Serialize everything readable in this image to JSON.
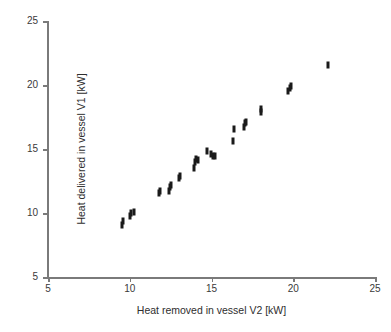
{
  "chart_data": {
    "type": "scatter",
    "title": "",
    "xlabel": "Heat removed in vessel V2 [kW]",
    "ylabel": "Heat delivered in vessel V1 [kW]",
    "xlim": [
      5,
      25
    ],
    "ylim": [
      5,
      25
    ],
    "xticks": [
      5,
      10,
      15,
      20,
      25
    ],
    "yticks": [
      5,
      10,
      15,
      20,
      25
    ],
    "xtick_labels": [
      "5",
      "10",
      "15",
      "20",
      "25"
    ],
    "ytick_labels": [
      "5",
      "10",
      "15",
      "20",
      "25"
    ],
    "grid": false,
    "legend": null,
    "marker": {
      "shape": "vertical-bar",
      "color": "#1a1a1a",
      "width_px": 3,
      "height_px": 7
    },
    "axis_color": "#7a7a7a",
    "background_color": "#ffffff",
    "series": [
      {
        "name": "Heat balance measurements",
        "points": [
          {
            "x": 9.5,
            "y": 9.1
          },
          {
            "x": 9.6,
            "y": 9.4
          },
          {
            "x": 10.0,
            "y": 9.8
          },
          {
            "x": 10.1,
            "y": 10.0
          },
          {
            "x": 10.25,
            "y": 10.1
          },
          {
            "x": 11.8,
            "y": 11.6
          },
          {
            "x": 11.85,
            "y": 11.75
          },
          {
            "x": 12.4,
            "y": 11.7
          },
          {
            "x": 12.45,
            "y": 12.0
          },
          {
            "x": 12.5,
            "y": 12.2
          },
          {
            "x": 13.0,
            "y": 12.7
          },
          {
            "x": 13.05,
            "y": 12.9
          },
          {
            "x": 13.95,
            "y": 13.55
          },
          {
            "x": 14.0,
            "y": 14.0
          },
          {
            "x": 14.05,
            "y": 14.2
          },
          {
            "x": 14.2,
            "y": 14.15
          },
          {
            "x": 14.75,
            "y": 14.85
          },
          {
            "x": 14.95,
            "y": 14.6
          },
          {
            "x": 15.1,
            "y": 14.45
          },
          {
            "x": 15.2,
            "y": 14.45
          },
          {
            "x": 16.3,
            "y": 15.6
          },
          {
            "x": 16.35,
            "y": 16.6
          },
          {
            "x": 17.0,
            "y": 16.7
          },
          {
            "x": 17.05,
            "y": 17.0
          },
          {
            "x": 17.1,
            "y": 17.1
          },
          {
            "x": 18.0,
            "y": 17.9
          },
          {
            "x": 18.05,
            "y": 18.1
          },
          {
            "x": 19.65,
            "y": 19.5
          },
          {
            "x": 19.8,
            "y": 19.8
          },
          {
            "x": 19.85,
            "y": 19.95
          },
          {
            "x": 22.1,
            "y": 21.55
          }
        ]
      }
    ]
  }
}
